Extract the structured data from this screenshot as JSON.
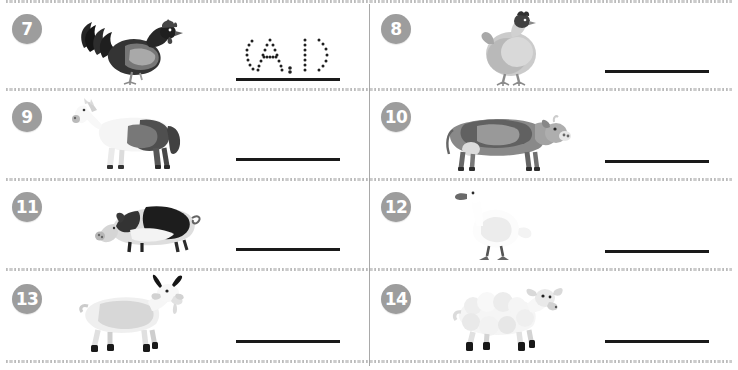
{
  "worksheet": {
    "title": "Farm Animals Tracing Worksheet",
    "columns": 2,
    "rows": 4,
    "separator_style": "speckled-dashed",
    "colors": {
      "badge_background": "#9d9d9d",
      "badge_text": "#ffffff",
      "answer_line": "#1a1a1a",
      "column_divider": "#9a9a9a",
      "row_separator": "#969696",
      "page_background": "#ffffff"
    }
  },
  "items": [
    {
      "number": "7",
      "animal_name": "rooster",
      "animal_icon": "rooster-photo",
      "answer_value": "",
      "answer_placeholder": "",
      "traced_text": "A. D",
      "traced_letters": [
        "A",
        ".",
        "D"
      ],
      "has_tracing": true
    },
    {
      "number": "8",
      "animal_name": "hen",
      "animal_icon": "hen-photo",
      "answer_value": "",
      "answer_placeholder": "",
      "traced_text": "",
      "traced_letters": [],
      "has_tracing": false
    },
    {
      "number": "9",
      "animal_name": "horse",
      "animal_icon": "horse-photo",
      "answer_value": "",
      "answer_placeholder": "",
      "traced_text": "",
      "traced_letters": [],
      "has_tracing": false
    },
    {
      "number": "10",
      "animal_name": "cow",
      "animal_icon": "cow-photo",
      "answer_value": "",
      "answer_placeholder": "",
      "traced_text": "",
      "traced_letters": [],
      "has_tracing": false
    },
    {
      "number": "11",
      "animal_name": "pig",
      "animal_icon": "pig-photo",
      "answer_value": "",
      "answer_placeholder": "",
      "traced_text": "",
      "traced_letters": [],
      "has_tracing": false
    },
    {
      "number": "12",
      "animal_name": "duck",
      "animal_icon": "duck-photo",
      "answer_value": "",
      "answer_placeholder": "",
      "traced_text": "",
      "traced_letters": [],
      "has_tracing": false
    },
    {
      "number": "13",
      "animal_name": "goat",
      "animal_icon": "goat-photo",
      "answer_value": "",
      "answer_placeholder": "",
      "traced_text": "",
      "traced_letters": [],
      "has_tracing": false
    },
    {
      "number": "14",
      "animal_name": "sheep",
      "animal_icon": "sheep-photo",
      "answer_value": "",
      "answer_placeholder": "",
      "traced_text": "",
      "traced_letters": [],
      "has_tracing": false
    }
  ]
}
